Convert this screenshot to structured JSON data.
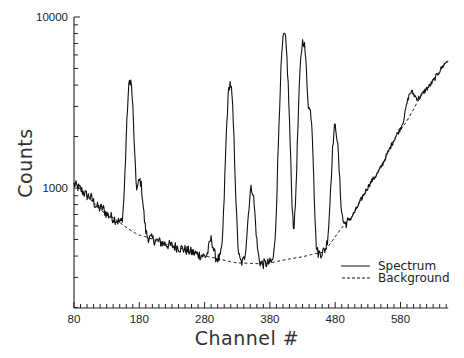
{
  "chart_data": {
    "type": "line",
    "title": "",
    "xlabel": "Channel #",
    "ylabel": "Counts",
    "xlim": [
      80,
      653
    ],
    "ylim": [
      200,
      10000
    ],
    "yscale": "log",
    "grid": false,
    "legend_position": "lower right inside",
    "x_ticks": [
      80,
      180,
      280,
      380,
      480,
      580
    ],
    "x_tick_labels": [
      "80",
      "180",
      "280",
      "380",
      "480",
      "580"
    ],
    "x_minor_tick_step": 10,
    "y_ticks": [
      1000,
      10000
    ],
    "y_tick_labels": [
      "1000",
      "10000"
    ],
    "series": [
      {
        "name": "Spectrum",
        "style": "solid",
        "peaks": [
          {
            "channel": 106,
            "counts": 880
          },
          {
            "channel": 124,
            "counts": 760
          },
          {
            "channel": 166,
            "counts": 4300
          },
          {
            "channel": 181,
            "counts": 1100
          },
          {
            "channel": 290,
            "counts": 500
          },
          {
            "channel": 319,
            "counts": 4100
          },
          {
            "channel": 352,
            "counts": 1000
          },
          {
            "channel": 402,
            "counts": 7800
          },
          {
            "channel": 431,
            "counts": 7300
          },
          {
            "channel": 443,
            "counts": 2300
          },
          {
            "channel": 480,
            "counts": 2270
          },
          {
            "channel": 595,
            "counts": 3600
          }
        ]
      },
      {
        "name": "Background",
        "style": "dashed",
        "points": [
          {
            "channel": 80,
            "counts": 1050
          },
          {
            "channel": 130,
            "counts": 700
          },
          {
            "channel": 180,
            "counts": 530
          },
          {
            "channel": 230,
            "counts": 460
          },
          {
            "channel": 280,
            "counts": 400
          },
          {
            "channel": 330,
            "counts": 365
          },
          {
            "channel": 370,
            "counts": 360
          },
          {
            "channel": 420,
            "counts": 390
          },
          {
            "channel": 460,
            "counts": 420
          },
          {
            "channel": 500,
            "counts": 640
          },
          {
            "channel": 540,
            "counts": 1150
          },
          {
            "channel": 580,
            "counts": 2200
          },
          {
            "channel": 620,
            "counts": 3800
          },
          {
            "channel": 653,
            "counts": 5600
          }
        ]
      }
    ]
  },
  "legend": {
    "items": [
      {
        "label": "Spectrum",
        "style": "solid"
      },
      {
        "label": "Background",
        "style": "dashed"
      }
    ]
  },
  "axes": {
    "x_title": "Channel #",
    "y_title": "Counts"
  },
  "colors": {
    "line": "#111111",
    "axis": "#222222",
    "background": "#ffffff"
  }
}
